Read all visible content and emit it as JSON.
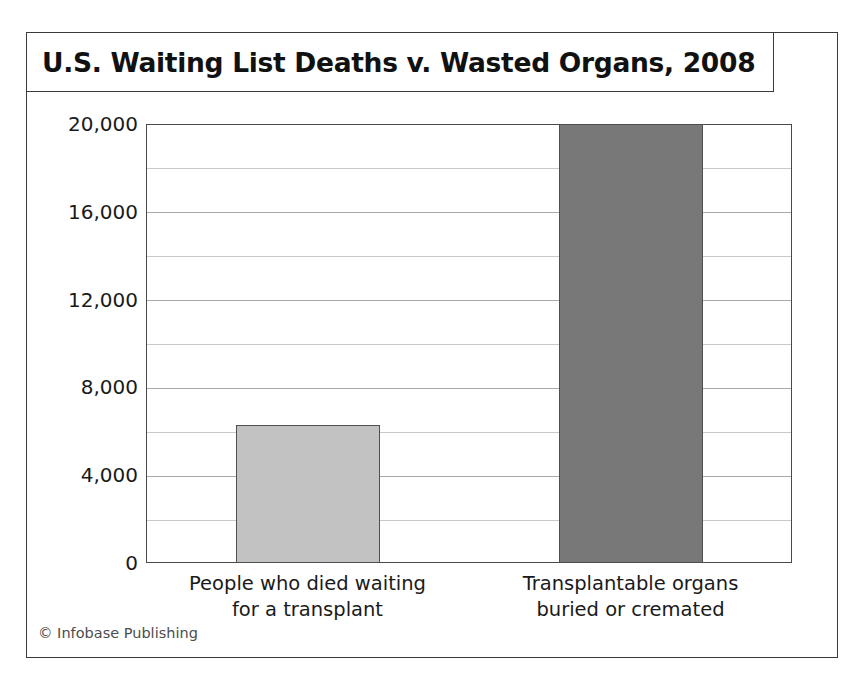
{
  "title": "U.S. Waiting List Deaths v. Wasted Organs, 2008",
  "footer": "© Infobase Publishing",
  "colors": {
    "bar_light": "#c2c2c2",
    "bar_dark": "#787878",
    "bar_border": "#4f4f4f",
    "frame": "#3a3a3a",
    "gridline": "#a8a8a8",
    "text": "#1a1a1a"
  },
  "chart_data": {
    "type": "bar",
    "title": "U.S. Waiting List Deaths v. Wasted Organs, 2008",
    "xlabel": "",
    "ylabel": "",
    "categories": [
      "People who died waiting for a transplant",
      "Transplantable organs buried or cremated"
    ],
    "category_lines": [
      [
        "People who died waiting",
        "for a transplant"
      ],
      [
        "Transplantable organs",
        "buried or cremated"
      ]
    ],
    "values": [
      6300,
      20000
    ],
    "bar_colors": [
      "#c2c2c2",
      "#787878"
    ],
    "ylim": [
      0,
      20000
    ],
    "ytick_values": [
      0,
      4000,
      8000,
      12000,
      16000,
      20000
    ],
    "ytick_labels": [
      "0",
      "4,000",
      "8,000",
      "12,000",
      "16,000",
      "20,000"
    ],
    "gridline_values": [
      2000,
      4000,
      6000,
      8000,
      10000,
      12000,
      14000,
      16000,
      18000
    ],
    "grid": true,
    "legend": false,
    "legend_position": "none"
  }
}
